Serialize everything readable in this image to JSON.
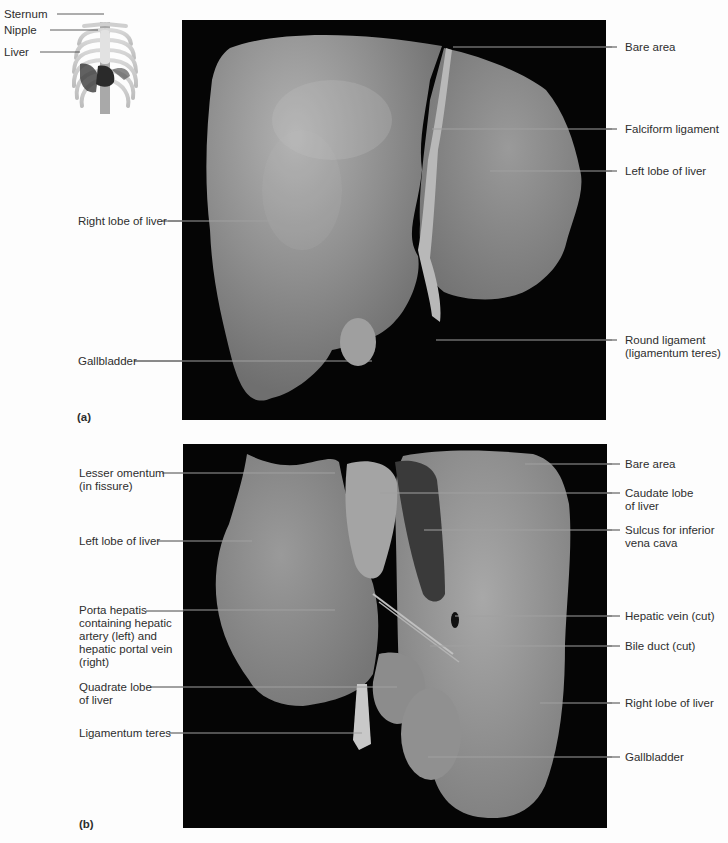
{
  "inset": {
    "labels": [
      "Sternum",
      "Nipple",
      "Liver"
    ]
  },
  "panel_a": {
    "tag": "(a)",
    "left_labels": [
      "Right lobe of liver",
      "Gallbladder"
    ],
    "right_labels": [
      "Bare area",
      "Falciform ligament",
      "Left lobe of liver",
      "Round ligament",
      "(ligamentum teres)"
    ]
  },
  "panel_b": {
    "tag": "(b)",
    "left_labels": [
      {
        "lines": [
          "Lesser omentum",
          "(in fissure)"
        ]
      },
      {
        "lines": [
          "Left lobe of liver"
        ]
      },
      {
        "lines": [
          "Porta hepatis",
          "containing hepatic",
          "artery (left) and",
          "hepatic portal vein",
          "(right)"
        ]
      },
      {
        "lines": [
          "Quadrate lobe",
          "of liver"
        ]
      },
      {
        "lines": [
          "Ligamentum teres"
        ]
      }
    ],
    "right_labels": [
      {
        "lines": [
          "Bare area"
        ]
      },
      {
        "lines": [
          "Caudate lobe",
          "of liver"
        ]
      },
      {
        "lines": [
          "Sulcus for inferior",
          "vena cava"
        ]
      },
      {
        "lines": [
          "Hepatic vein (cut)"
        ]
      },
      {
        "lines": [
          "Bile duct (cut)"
        ]
      },
      {
        "lines": [
          "Right lobe of liver"
        ]
      },
      {
        "lines": [
          "Gallbladder"
        ]
      }
    ]
  },
  "colors": {
    "background": "#fdfdfd",
    "photo_bg": "#050505",
    "tissue": "#8a8a8a",
    "leader": "#9a9a9a",
    "text": "#2e2e2e"
  }
}
